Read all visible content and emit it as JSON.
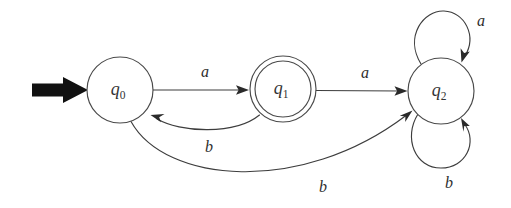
{
  "diagram": {
    "type": "finite-state-automaton",
    "title": "",
    "background_color": "#ffffff",
    "stroke_color": "#3d3d3d",
    "start_arrow_color": "#111111",
    "states": [
      {
        "id": "q0",
        "label_base": "q",
        "label_sub": "0",
        "cx": 120,
        "cy": 90,
        "r": 33,
        "accepting": false,
        "initial": true
      },
      {
        "id": "q1",
        "label_base": "q",
        "label_sub": "1",
        "cx": 283,
        "cy": 89,
        "r": 33,
        "r_inner": 28,
        "accepting": true,
        "initial": false
      },
      {
        "id": "q2",
        "label_base": "q",
        "label_sub": "2",
        "cx": 441,
        "cy": 91,
        "r": 33,
        "accepting": false,
        "initial": false
      }
    ],
    "transitions": [
      {
        "from": "q0",
        "to": "q1",
        "symbol": "a",
        "label_x": 205,
        "label_y": 73
      },
      {
        "from": "q1",
        "to": "q2",
        "symbol": "a",
        "label_x": 365,
        "label_y": 74
      },
      {
        "from": "q1",
        "to": "q0",
        "symbol": "b",
        "label_x": 209,
        "label_y": 148
      },
      {
        "from": "q0",
        "to": "q2",
        "symbol": "b",
        "label_x": 323,
        "label_y": 188
      },
      {
        "from": "q2",
        "to": "q2",
        "symbol": "a",
        "label_x": 481,
        "label_y": 22
      },
      {
        "from": "q2",
        "to": "q2",
        "symbol": "b",
        "label_x": 449,
        "label_y": 184
      }
    ],
    "start_marker": {
      "name": "start-arrow",
      "from_x": 32,
      "to_x": 88,
      "y": 90
    }
  }
}
